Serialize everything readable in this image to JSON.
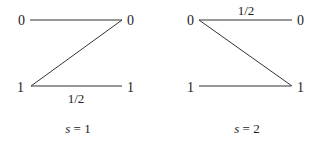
{
  "diagrams": [
    {
      "caption": "s = 1",
      "caption_var": "s",
      "caption_rest": " = 1",
      "nodes": {
        "top_left": "0",
        "top_right": "0",
        "bottom_left": "1",
        "bottom_right": "1"
      },
      "edges": [
        {
          "from": "top_left",
          "to": "top_right",
          "label": ""
        },
        {
          "from": "top_right",
          "to": "bottom_left",
          "label": ""
        },
        {
          "from": "bottom_left",
          "to": "bottom_right",
          "label": "1/2"
        }
      ]
    },
    {
      "caption": "s = 2",
      "caption_var": "s",
      "caption_rest": " = 2",
      "nodes": {
        "top_left": "0",
        "top_right": "0",
        "bottom_left": "1",
        "bottom_right": "1"
      },
      "edges": [
        {
          "from": "top_left",
          "to": "top_right",
          "label": "1/2"
        },
        {
          "from": "top_left",
          "to": "bottom_right",
          "label": ""
        },
        {
          "from": "bottom_left",
          "to": "bottom_right",
          "label": ""
        }
      ]
    }
  ],
  "colors": {
    "stroke": "#333333",
    "text": "#222222",
    "background": "#ffffff"
  }
}
